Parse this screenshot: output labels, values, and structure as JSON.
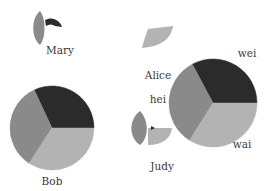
{
  "chart_data": {
    "type": "pie",
    "title": "",
    "colors": {
      "dark": "#2b2b2b",
      "mid": "#8a8a8a",
      "light": "#b3b3b3"
    },
    "nodes": [
      {
        "name": "Bob",
        "cx": 52,
        "cy": 128,
        "r": 42,
        "label": {
          "text": "Bob",
          "x": 52,
          "y": 185
        },
        "slices": [
          {
            "shade": "dark",
            "start": 0,
            "end": 115,
            "value": 0.32
          },
          {
            "shade": "mid",
            "start": 115,
            "end": 237,
            "value": 0.34
          },
          {
            "shade": "light",
            "start": 237,
            "end": 360,
            "value": 0.34
          }
        ]
      },
      {
        "name": "big",
        "cx": 213,
        "cy": 103,
        "r": 44,
        "label": {
          "text": "",
          "x": 0,
          "y": 0
        },
        "slices": [
          {
            "shade": "dark",
            "start": 0,
            "end": 118,
            "value": 0.33
          },
          {
            "shade": "mid",
            "start": 118,
            "end": 238,
            "value": 0.33
          },
          {
            "shade": "light",
            "start": 238,
            "end": 360,
            "value": 0.34
          }
        ]
      }
    ],
    "fragments": [
      {
        "name": "Mary-lens",
        "shade": "mid",
        "path": "M40,11 C31,18 31,38 40,45 C46,38 46,18 40,11 Z"
      },
      {
        "name": "Mary-wedge",
        "shade": "dark",
        "path": "M45,20 C52,16 60,20 62,27 L55,26 C52,24 49,24 46,26 Z"
      },
      {
        "name": "Alice-fan",
        "shade": "light",
        "path": "M148,29 L173,26 C171,38 163,46 142,48 C144,40 146,34 148,29 Z"
      },
      {
        "name": "Judy-lens",
        "shade": "mid",
        "path": "M140,111 C128,120 129,138 140,145 C149,138 149,120 140,111 Z"
      },
      {
        "name": "Judy-wedge",
        "shade": "light",
        "path": "M148,128 L172,128 C171,138 163,145 148,145 Z"
      },
      {
        "name": "Judy-dot",
        "shade": "dark",
        "path": "M151,126 L155,128 L151,130 Z"
      }
    ],
    "labels": [
      {
        "text": "Mary",
        "x": 60,
        "y": 54
      },
      {
        "text": "Alice",
        "x": 158,
        "y": 79
      },
      {
        "text": "hei",
        "x": 158,
        "y": 103
      },
      {
        "text": "wei",
        "x": 247,
        "y": 57
      },
      {
        "text": "wai",
        "x": 242,
        "y": 148
      },
      {
        "text": "Judy",
        "x": 162,
        "y": 170
      },
      {
        "text": "Bob",
        "x": 52,
        "y": 185
      }
    ],
    "xlabel": "",
    "ylabel": ""
  }
}
